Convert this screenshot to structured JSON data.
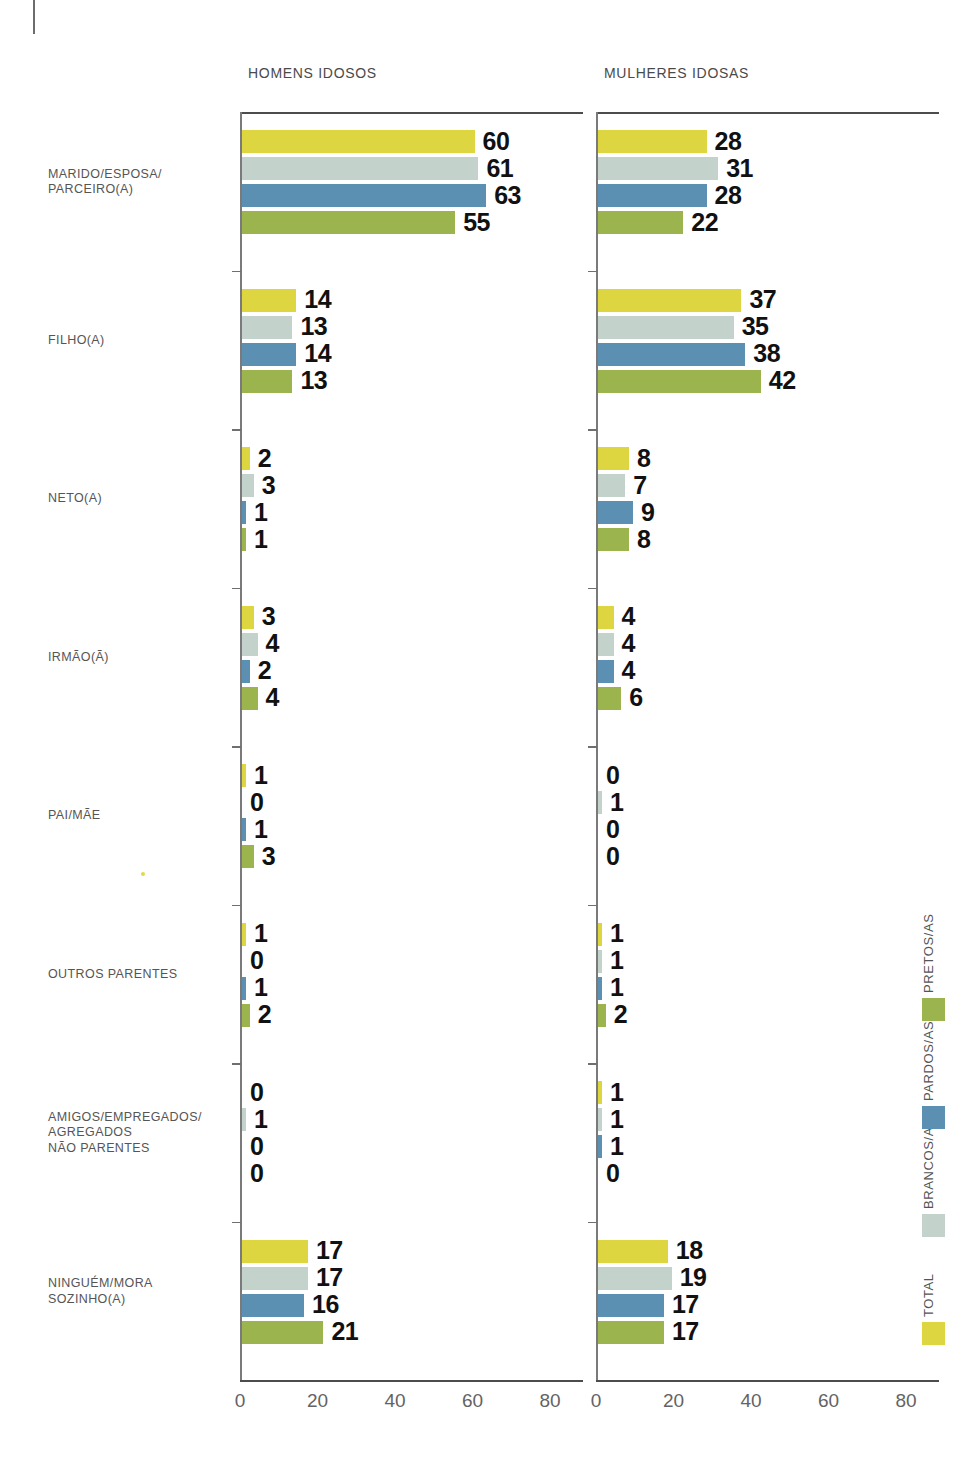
{
  "panels": [
    {
      "id": "men",
      "title": "HOMENS IDOSOS"
    },
    {
      "id": "women",
      "title": "MULHERES IDOSAS"
    }
  ],
  "legend": {
    "items": [
      {
        "label": "TOTAL",
        "color": "#ddd641"
      },
      {
        "label": "BRANCOS/AS",
        "color": "#c3d3cb"
      },
      {
        "label": "PARDOS/AS",
        "color": "#5c90b2"
      },
      {
        "label": "PRETOS/AS",
        "color": "#9cb44d"
      }
    ]
  },
  "axis": {
    "ticks": [
      0,
      20,
      40,
      60,
      80
    ],
    "tick_labels": [
      "0",
      "20",
      "40",
      "60",
      "80"
    ],
    "xmin": 0,
    "xmax": 88
  },
  "chart_data": {
    "type": "bar",
    "title": "",
    "orientation": "horizontal",
    "xlabel": "",
    "ylabel": "",
    "xlim": [
      0,
      88
    ],
    "grid": false,
    "legend_position": "right-rotated",
    "categories": [
      "MARIDO/ESPOSA/\nPARCEIRO(A)",
      "FILHO(A)",
      "NETO(A)",
      "IRMÃO(Ã)",
      "PAI/MÃE",
      "OUTROS PARENTES",
      "AMIGOS/EMPREGADOS/\nAGREGADOS\nNÃO PARENTES",
      "NINGUÉM/MORA\nSOZINHO(A)"
    ],
    "series_names": [
      "TOTAL",
      "BRANCOS/AS",
      "PARDOS/AS",
      "PRETOS/AS"
    ],
    "series_colors": [
      "#ddd641",
      "#c3d3cb",
      "#5c90b2",
      "#9cb44d"
    ],
    "panels": [
      {
        "name": "HOMENS IDOSOS",
        "series": [
          {
            "name": "TOTAL",
            "values": [
              60,
              14,
              2,
              3,
              1,
              1,
              0,
              17
            ]
          },
          {
            "name": "BRANCOS/AS",
            "values": [
              61,
              13,
              3,
              4,
              0,
              0,
              1,
              17
            ]
          },
          {
            "name": "PARDOS/AS",
            "values": [
              63,
              14,
              1,
              2,
              1,
              1,
              0,
              16
            ]
          },
          {
            "name": "PRETOS/AS",
            "values": [
              55,
              13,
              1,
              4,
              3,
              2,
              0,
              21
            ]
          }
        ]
      },
      {
        "name": "MULHERES IDOSAS",
        "series": [
          {
            "name": "TOTAL",
            "values": [
              28,
              37,
              8,
              4,
              0,
              1,
              1,
              18
            ]
          },
          {
            "name": "BRANCOS/AS",
            "values": [
              31,
              35,
              7,
              4,
              1,
              1,
              1,
              19
            ]
          },
          {
            "name": "PARDOS/AS",
            "values": [
              28,
              38,
              9,
              4,
              0,
              1,
              1,
              17
            ]
          },
          {
            "name": "PRETOS/AS",
            "values": [
              22,
              42,
              8,
              6,
              0,
              2,
              0,
              17
            ]
          }
        ]
      }
    ]
  }
}
